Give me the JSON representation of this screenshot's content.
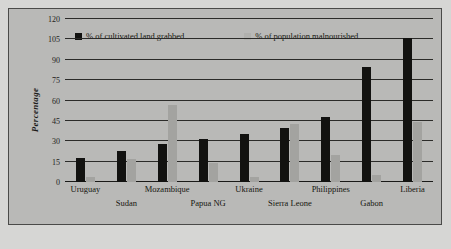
{
  "chart_data": {
    "type": "bar",
    "title": "",
    "xlabel": "",
    "ylabel": "Percentage",
    "ylim": [
      0,
      120
    ],
    "yticks": [
      0,
      15,
      30,
      45,
      60,
      75,
      90,
      105,
      120
    ],
    "grid": true,
    "legend_position": "top-left",
    "categories": [
      "Uruguay",
      "Sudan",
      "Mozambique",
      "Papua NG",
      "Ukraine",
      "Sierra Leone",
      "Philippines",
      "Gabon",
      "Liberia"
    ],
    "series": [
      {
        "name": "% of cultivated land grabbed",
        "color": "#121210",
        "values": [
          18,
          23,
          28,
          32,
          35,
          40,
          48,
          85,
          106
        ]
      },
      {
        "name": "% of population malnourished",
        "color": "#a3a3a0",
        "values": [
          4,
          17,
          57,
          14,
          4,
          43,
          20,
          5,
          44
        ]
      }
    ]
  },
  "legend": {
    "series_1_label": "% of cultivated land grabbed",
    "series_2_label": "% of population malnourished"
  },
  "axis": {
    "y_title": "Percentage"
  }
}
